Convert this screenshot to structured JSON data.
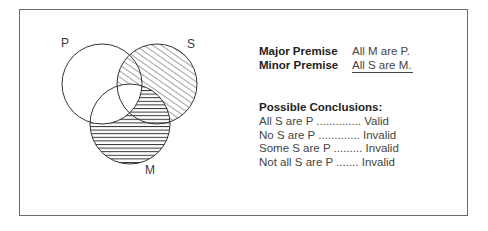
{
  "diagram": {
    "type": "venn",
    "circles": [
      {
        "label": "P",
        "cx": 102,
        "cy": 84,
        "r": 40
      },
      {
        "label": "S",
        "cx": 157,
        "cy": 84,
        "r": 40
      },
      {
        "label": "M",
        "cx": 130,
        "cy": 124,
        "r": 40
      }
    ],
    "shading": {
      "diagonal_hatch": "S outside M",
      "horizontal_hatch": "M outside P"
    }
  },
  "labels": {
    "p": "P",
    "s": "S",
    "m": "M"
  },
  "premises": {
    "major": {
      "name": "Major Premise",
      "value": "All M are P."
    },
    "minor": {
      "name": "Minor Premise",
      "value": "All S are M."
    }
  },
  "conclusions": {
    "title": "Possible Conclusions:",
    "items": [
      {
        "statement": "All S are P",
        "dots": " ..............",
        "result": " Valid"
      },
      {
        "statement": "No S are P",
        "dots": " .............",
        "result": " Invalid"
      },
      {
        "statement": "Some S are P",
        "dots": " .........",
        "result": " Invalid"
      },
      {
        "statement": "Not all S are P",
        "dots": " .......",
        "result": " Invalid"
      }
    ]
  }
}
